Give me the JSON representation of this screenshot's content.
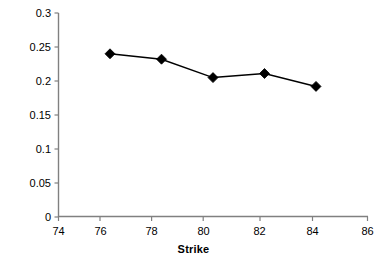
{
  "chart_data": {
    "type": "line",
    "title": "",
    "subtitle": "",
    "xlabel": "Strike",
    "ylabel": "",
    "xlim": [
      74,
      86
    ],
    "ylim": [
      0,
      0.3
    ],
    "x": [
      76,
      78,
      80,
      82,
      84
    ],
    "values": [
      0.24,
      0.232,
      0.205,
      0.211,
      0.192
    ],
    "series": [
      {
        "name": "",
        "x": [
          76,
          78,
          80,
          82,
          84
        ],
        "values": [
          0.24,
          0.232,
          0.205,
          0.211,
          0.192
        ],
        "marker": "diamond",
        "color": "#000000"
      }
    ],
    "x_ticks": [
      74,
      76,
      78,
      80,
      82,
      84,
      86
    ],
    "x_tick_labels": [
      "74",
      "76",
      "78",
      "80",
      "82",
      "84",
      "86"
    ],
    "y_ticks": [
      0,
      0.05,
      0.1,
      0.15,
      0.2,
      0.25,
      0.3
    ],
    "y_tick_labels": [
      "0",
      "0.05",
      "0.1",
      "0.15",
      "0.2",
      "0.25",
      "0.3"
    ],
    "grid": false,
    "legend": false,
    "legend_position": "none",
    "annotations": [],
    "colors": {
      "line": "#000000",
      "marker": "#000000",
      "axis": "#808080",
      "text": "#000000",
      "background": "#ffffff"
    }
  }
}
